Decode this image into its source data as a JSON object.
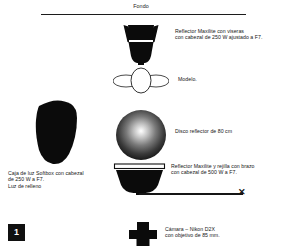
{
  "diagram": {
    "backdrop": {
      "label": "Fondo"
    },
    "badge": {
      "number": "1"
    },
    "boom": {
      "end_marker": "✕"
    },
    "annotations": [
      {
        "id": "maxilite-top",
        "text": "Reflector Maxilite con viseras\ncon cabezal de 250 W ajustado a F7."
      },
      {
        "id": "modelo",
        "text": "Modelo."
      },
      {
        "id": "disco",
        "text": "Disco reflector de 80 cm"
      },
      {
        "id": "maxilite-bot",
        "text": "Reflector Maxilite y rejilla con brazo\ncon cabezal de 500 W a F7."
      },
      {
        "id": "softbox",
        "text": "Caja de luz Softbox con cabezal\nde 250 W a F7.\nLuz de relleno"
      },
      {
        "id": "camara",
        "text": "Cámara – Nikon D2X\ncon objetivo de 85 mm."
      }
    ],
    "colors": {
      "ink": "#151515",
      "paper": "#ffffff",
      "badge_bg": "#101010",
      "badge_fg": "#ffffff"
    }
  }
}
